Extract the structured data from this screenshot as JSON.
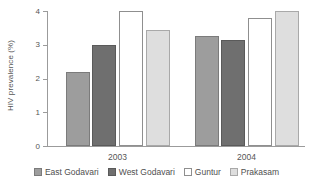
{
  "chart_data": {
    "type": "bar",
    "title": "",
    "subtitle": "",
    "xlabel": "",
    "ylabel": "HIV prevalence (%)",
    "categories": [
      "2003",
      "2004"
    ],
    "ylim": [
      0,
      4
    ],
    "yticks": [
      "0",
      "1",
      "2",
      "3",
      "4"
    ],
    "ytick_values": [
      0,
      1,
      2,
      3,
      4
    ],
    "grid": false,
    "legend_position": "bottom",
    "series": [
      {
        "name": "East Godavari",
        "values": [
          2.2,
          3.25
        ],
        "color": "#9d9d9d"
      },
      {
        "name": "West Godavari",
        "values": [
          3.0,
          3.15
        ],
        "color": "#6f6f6f"
      },
      {
        "name": "Guntur",
        "values": [
          4.0,
          3.78
        ],
        "color": "#ffffff"
      },
      {
        "name": "Prakasam",
        "values": [
          3.45,
          4.0
        ],
        "color": "#dedede"
      }
    ]
  },
  "axis": {
    "line_color": "#9b9b9b"
  }
}
